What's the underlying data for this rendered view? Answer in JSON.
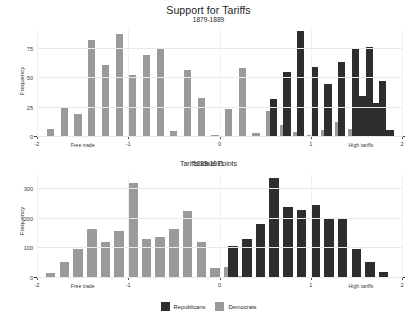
{
  "chart_data": [
    {
      "type": "bar",
      "id": "panel-1879-1889",
      "title": "Support for Tariffs",
      "subtitle": "1879-1889",
      "xlabel": "Tariffs Ideal Points",
      "ylabel": "Frequency",
      "xlim": [
        -2,
        2
      ],
      "ylim": [
        0,
        92
      ],
      "yticks": [
        0,
        25,
        50,
        75
      ],
      "xticks": [
        -2,
        -1,
        0,
        1,
        2
      ],
      "xtick_labels": [
        "-2",
        "-1",
        "0",
        "1",
        "2"
      ],
      "ytick_labels": [
        "0",
        "25",
        "50",
        "75"
      ],
      "grid": true,
      "legend_position": "bottom",
      "annotations": [
        {
          "text": "Free trade",
          "x": -1.5
        },
        {
          "text": "High tariffs",
          "x": 1.55
        }
      ],
      "bin_centers": [
        -1.85,
        -1.7,
        -1.55,
        -1.4,
        -1.25,
        -1.1,
        -0.95,
        -0.8,
        -0.65,
        -0.5,
        -0.35,
        -0.2,
        -0.05,
        0.1,
        0.25,
        0.4,
        0.55,
        0.7,
        0.85,
        1.0,
        1.15,
        1.3,
        1.45,
        1.6,
        1.75
      ],
      "series": [
        {
          "name": "Democrats",
          "color": "#9a9a9a",
          "values": [
            7,
            25,
            20,
            83,
            61,
            88,
            53,
            70,
            76,
            5,
            57,
            33,
            2,
            24,
            59,
            3,
            22,
            10,
            4,
            2,
            6,
            13,
            7,
            0,
            0
          ]
        },
        {
          "name": "Republicans",
          "color": "#2e2e2e",
          "values": [
            0,
            0,
            0,
            0,
            0,
            0,
            1,
            0,
            0,
            0,
            0,
            0,
            0,
            0,
            0,
            0,
            32,
            55,
            90,
            60,
            45,
            64,
            75,
            77,
            48
          ]
        }
      ],
      "republicans_tail": {
        "bin_centers": [
          1.45,
          1.6,
          1.75
        ],
        "values": [
          35,
          29,
          6
        ]
      }
    },
    {
      "type": "bar",
      "id": "panel-1889-1911",
      "subtitle": "1889-1911",
      "xlabel": "Tariffs Ideal Points",
      "ylabel": "Frequency",
      "xlim": [
        -2,
        2
      ],
      "ylim": [
        0,
        350
      ],
      "yticks": [
        0,
        100,
        200,
        300
      ],
      "xticks": [
        -2,
        -1,
        0,
        1,
        2
      ],
      "xtick_labels": [
        "-2",
        "-1",
        "0",
        "1",
        "2"
      ],
      "ytick_labels": [
        "0",
        "100",
        "200",
        "300"
      ],
      "grid": true,
      "legend_position": "bottom",
      "annotations": [
        {
          "text": "Free trade",
          "x": -1.5
        },
        {
          "text": "High tariffs",
          "x": 1.55
        }
      ],
      "bin_centers": [
        -1.85,
        -1.7,
        -1.55,
        -1.4,
        -1.25,
        -1.1,
        -0.95,
        -0.8,
        -0.65,
        -0.5,
        -0.35,
        -0.2,
        -0.05,
        0.1,
        0.25,
        0.4,
        0.55,
        0.7,
        0.85,
        1.0,
        1.15,
        1.3,
        1.45,
        1.6,
        1.75
      ],
      "series": [
        {
          "name": "Democrats",
          "color": "#9a9a9a",
          "values": [
            18,
            55,
            97,
            165,
            120,
            158,
            320,
            130,
            137,
            165,
            225,
            120,
            35,
            37,
            8,
            3,
            2,
            4,
            3,
            0,
            0,
            0,
            0,
            0,
            0
          ]
        },
        {
          "name": "Republicans",
          "color": "#2e2e2e",
          "values": [
            0,
            0,
            0,
            0,
            0,
            0,
            0,
            0,
            0,
            0,
            0,
            0,
            0,
            107,
            130,
            182,
            338,
            238,
            230,
            245,
            198,
            202,
            97,
            55,
            20
          ]
        }
      ]
    }
  ],
  "legend": {
    "items": [
      {
        "label": "Republicans",
        "color": "#2e2e2e"
      },
      {
        "label": "Democrats",
        "color": "#9a9a9a"
      }
    ]
  },
  "colors": {
    "republicans": "#2e2e2e",
    "democrats": "#9a9a9a",
    "axis": "#3d3d3d",
    "grid": "#eaeaea",
    "text": "#222222",
    "background": "#ffffff"
  }
}
